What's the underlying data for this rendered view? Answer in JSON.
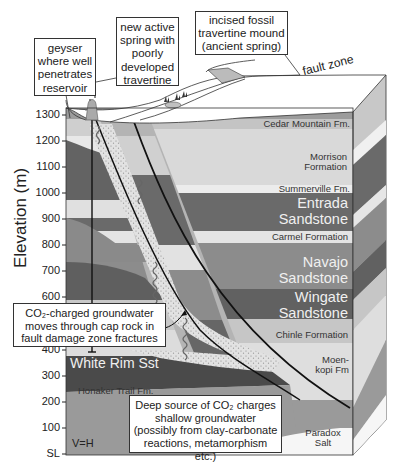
{
  "callouts": {
    "geyser": "geyser where well penetrates reservoir",
    "new_spring": "new active spring with poorly developed travertine",
    "fossil_mound": "incised fossil travertine mound (ancient spring)",
    "cap_rock": "CO₂-charged groundwater moves through cap rock in fault damage zone fractures",
    "deep_source": "Deep source of CO₂ charges shallow groundwater (possibly from clay-carbonate reactions, metamorphism etc.)"
  },
  "labels": {
    "fault_zone": "fault zone",
    "scale_note": "V=H",
    "question_mark": "?"
  },
  "axis": {
    "title": "Elevation (m)",
    "ticks": [
      "1300",
      "1200",
      "1100",
      "1000",
      "900",
      "800",
      "700",
      "600",
      "400",
      "300",
      "200",
      "100",
      "SL"
    ]
  },
  "formations": {
    "cedar_mountain": "Cedar Mountain Fm.",
    "morrison": "Morrison Formation",
    "summerville": "Summerville Fm.",
    "entrada": "Entrada Sandstone",
    "carmel": "Carmel Formation",
    "navajo": "Navajo Sandstone",
    "wingate": "Wingate Sandstone",
    "chinle": "Chinle Formation",
    "moenkopi": "Moen- kopi Fm",
    "white_rim": "White Rim Sst",
    "honaker_trail": "Honaker Trail Fm.",
    "paradox": "Paradox Salt"
  },
  "colors": {
    "light_gray": "#d6d6d6",
    "mid_gray": "#a8a8a8",
    "dark_gray": "#6e6e6e",
    "darker_gray": "#5a5a5a",
    "pale": "#e6e6e6"
  }
}
